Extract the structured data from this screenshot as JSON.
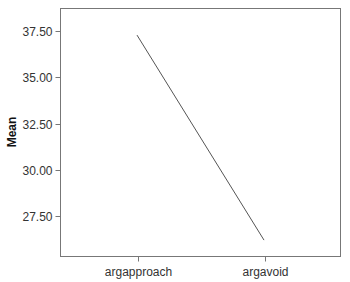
{
  "chart_data": {
    "type": "line",
    "title": "",
    "xlabel": "",
    "ylabel": "Mean",
    "categories": [
      "argapproach",
      "argavoid"
    ],
    "series": [
      {
        "name": "Mean",
        "values": [
          37.28,
          26.2
        ]
      }
    ],
    "yticks": [
      "27.50",
      "30.00",
      "32.50",
      "35.00",
      "37.50"
    ],
    "ytick_values": [
      27.5,
      30.0,
      32.5,
      35.0,
      37.5
    ],
    "ylim": [
      25.2,
      39.0
    ],
    "grid": false,
    "legend": null,
    "line_color": "#555555"
  }
}
